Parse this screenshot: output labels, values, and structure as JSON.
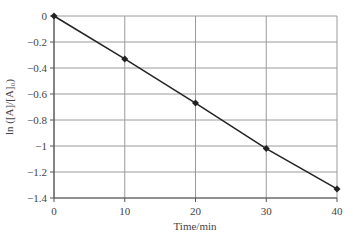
{
  "chart_data": {
    "type": "line",
    "title": "",
    "xlabel": "Time/min",
    "ylabel": "ln ([A]/[A]₀)",
    "x": [
      0,
      10,
      20,
      30,
      40
    ],
    "series": [
      {
        "name": "ln([A]/[A]0)",
        "values": [
          0,
          -0.33,
          -0.67,
          -1.02,
          -1.33
        ],
        "marker": "diamond",
        "color": "#222222"
      }
    ],
    "xlim": [
      0,
      40
    ],
    "ylim": [
      -1.4,
      0
    ],
    "xticks": [
      0,
      10,
      20,
      30,
      40
    ],
    "xtick_labels": [
      "0",
      "10",
      "20",
      "30",
      "40"
    ],
    "yticks": [
      0,
      -0.2,
      -0.4,
      -0.6,
      -0.8,
      -1,
      -1.2,
      -1.4
    ],
    "ytick_labels": [
      "0",
      "−0.2",
      "−0.4",
      "−0.6",
      "−0.8",
      "−1",
      "−1.2",
      "−1.4"
    ],
    "grid": true,
    "legend": "none"
  },
  "colors": {
    "line": "#222222",
    "grid": "#9a9a9a",
    "axis": "#555555",
    "text": "#444444"
  }
}
